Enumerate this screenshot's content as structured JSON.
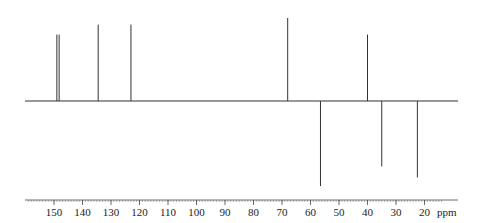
{
  "chart_data": {
    "type": "bar",
    "title": "",
    "xlabel": "ppm",
    "ylabel": "",
    "x_reversed": true,
    "xlim": [
      160,
      15
    ],
    "grid": false,
    "legend": null,
    "tick_labels": [
      "150",
      "140",
      "130",
      "120",
      "110",
      "100",
      "90",
      "80",
      "70",
      "60",
      "50",
      "40",
      "30",
      "20"
    ],
    "unit_label": "ppm",
    "peaks": [
      {
        "ppm": 149.0,
        "intensity": 0.8,
        "direction": "up"
      },
      {
        "ppm": 148.2,
        "intensity": 0.8,
        "direction": "up"
      },
      {
        "ppm": 134.5,
        "intensity": 0.92,
        "direction": "up"
      },
      {
        "ppm": 123.0,
        "intensity": 0.92,
        "direction": "up"
      },
      {
        "ppm": 68.0,
        "intensity": 1.0,
        "direction": "up"
      },
      {
        "ppm": 56.5,
        "intensity": -1.0,
        "direction": "down"
      },
      {
        "ppm": 40.0,
        "intensity": 0.8,
        "direction": "up"
      },
      {
        "ppm": 35.0,
        "intensity": -0.77,
        "direction": "down"
      },
      {
        "ppm": 22.5,
        "intensity": -0.9,
        "direction": "down"
      }
    ]
  },
  "colors": {
    "trace": "#333333",
    "axis": "#444444"
  }
}
